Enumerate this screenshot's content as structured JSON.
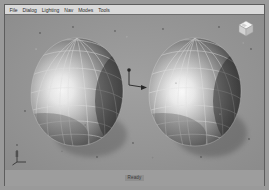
{
  "window": {
    "title": "3D Modeler"
  },
  "menubar": {
    "items": [
      {
        "label": "File",
        "name": "menu-file"
      },
      {
        "label": "Dialog",
        "name": "menu-dialog"
      },
      {
        "label": "Lighting",
        "name": "menu-lighting"
      },
      {
        "label": "Nav",
        "name": "menu-nav"
      },
      {
        "label": "Modes",
        "name": "menu-modes"
      },
      {
        "label": "Tools",
        "name": "menu-tools"
      }
    ]
  },
  "viewport": {
    "background_color": "#9b9b9b",
    "shading_mode": "smooth-shaded-wireframe",
    "objects": [
      {
        "name": "egg-surface-left",
        "label": "Surface 1",
        "wireframe_color": "#e8e8e8",
        "surface_highlight": "#ffffff",
        "surface_shadow": "#3c3c3c",
        "center_x": 72,
        "center_y": 78,
        "width": 92,
        "height": 110
      },
      {
        "name": "egg-surface-right",
        "label": "Surface 2",
        "wireframe_color": "#e8e8e8",
        "surface_highlight": "#ffffff",
        "surface_shadow": "#3c3c3c",
        "center_x": 190,
        "center_y": 78,
        "width": 92,
        "height": 110
      }
    ],
    "manipulator": {
      "name": "move-manipulator",
      "color": "#2b2b2b",
      "x": 128,
      "y": 62
    }
  },
  "navcube": {
    "label": "ViewCube",
    "face_color": "#f2f2f2",
    "side_color": "#c9c9c9"
  },
  "axisgizmo": {
    "label": "Axis",
    "axes": [
      "x",
      "y",
      "z"
    ],
    "color": "#4a4a4a"
  },
  "statusbar": {
    "text": "Ready"
  }
}
